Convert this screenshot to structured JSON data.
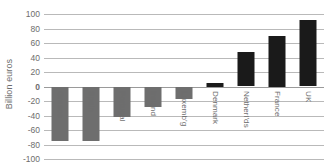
{
  "chart_data": {
    "type": "bar",
    "title": "",
    "subtitle": "",
    "xlabel": "",
    "ylabel": "Billion euros",
    "ylim": [
      -100,
      100
    ],
    "ytick_step": 20,
    "yticks": [
      100,
      80,
      60,
      40,
      20,
      0,
      -20,
      -40,
      -60,
      -80,
      -100
    ],
    "ytick_labels": [
      "100",
      "80",
      "60",
      "40",
      "20",
      "0",
      "-20",
      "-40",
      "-60",
      "-80",
      "-100"
    ],
    "grid": true,
    "legend": false,
    "legend_position": "none",
    "categories": [
      "Greece",
      "Spain",
      "Portugal",
      "Ireland",
      "Luxemb'g",
      "Denmark",
      "Netherl'ds",
      "France",
      "UK"
    ],
    "values": [
      -75,
      -75,
      -42,
      -28,
      -17,
      5,
      48,
      70,
      92
    ],
    "colors": {
      "negative_bar": "#6e6e6e",
      "positive_bar": "#1a1a1a",
      "gridline": "#b9b9b9",
      "zero_line": "#9a9a9a",
      "text": "#6d6d6d",
      "background": "#ffffff"
    }
  }
}
